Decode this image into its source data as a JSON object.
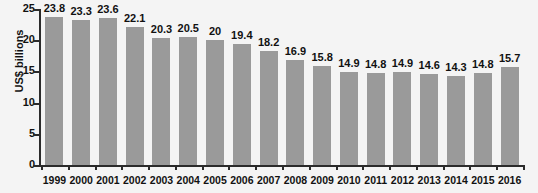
{
  "chart_data": {
    "type": "bar",
    "title": "",
    "xlabel": "",
    "ylabel": "US$ billions",
    "ylim": [
      0,
      25
    ],
    "yticks": [
      0,
      5,
      10,
      15,
      20,
      25
    ],
    "grid": false,
    "legend": null,
    "bar_color": "#9a9a9a",
    "background_color": "#f4f4f4",
    "axis_color": "#2b2b2b",
    "categories": [
      "1999",
      "2000",
      "2001",
      "2002",
      "2003",
      "2004",
      "2005",
      "2006",
      "2007",
      "2008",
      "2009",
      "2010",
      "2011",
      "2012",
      "2013",
      "2014",
      "2015",
      "2016"
    ],
    "values": [
      23.8,
      23.3,
      23.6,
      22.1,
      20.3,
      20.5,
      20,
      19.4,
      18.2,
      16.9,
      15.8,
      14.9,
      14.8,
      14.9,
      14.6,
      14.3,
      14.8,
      15.7
    ],
    "value_labels": [
      "23.8",
      "23.3",
      "23.6",
      "22.1",
      "20.3",
      "20.5",
      "20",
      "19.4",
      "18.2",
      "16.9",
      "15.8",
      "14.9",
      "14.8",
      "14.9",
      "14.6",
      "14.3",
      "14.8",
      "15.7"
    ],
    "ytick_labels": [
      "0",
      "5",
      "10",
      "15",
      "20",
      "25"
    ]
  }
}
